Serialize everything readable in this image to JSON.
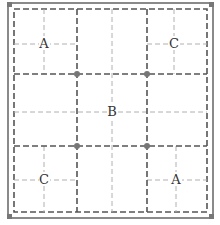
{
  "diagram": {
    "labels": {
      "top_left": "A",
      "top_right": "C",
      "center": "B",
      "bottom_left": "C",
      "bottom_right": "A"
    },
    "colors": {
      "border": "#888888",
      "thick_dash": "#555555",
      "thin_dash": "#aaaaaa",
      "node": "#777777",
      "corner": "#666666"
    }
  }
}
